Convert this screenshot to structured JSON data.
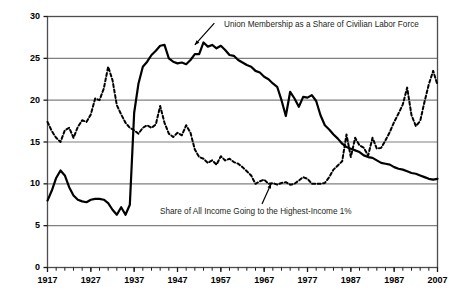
{
  "chart_data": {
    "type": "line",
    "title": "",
    "xlabel": "",
    "ylabel": "",
    "xlim": [
      1917,
      2007
    ],
    "ylim": [
      0,
      30
    ],
    "grid": true,
    "gridlines_y": [
      5,
      10,
      15,
      20,
      25
    ],
    "legend_position": "inline-annotations",
    "y_ticks": [
      "0",
      "5",
      "10",
      "15",
      "20",
      "25",
      "30"
    ],
    "y_tick_values": [
      0,
      5,
      10,
      15,
      20,
      25,
      30
    ],
    "x_ticks": [
      "1917",
      "1927",
      "1937",
      "1947",
      "1957",
      "1967",
      "1977",
      "1987",
      "1987",
      "2007"
    ],
    "x_tick_values": [
      1917,
      1927,
      1937,
      1947,
      1957,
      1967,
      1977,
      1987,
      1997,
      2007
    ],
    "minor_tick_interval": 2,
    "annotations": [
      {
        "name": "union-membership-label",
        "text": "Union Membership as a Share of Civilian Labor Force",
        "arrow_from": [
          1955.5,
          29.2
        ],
        "arrow_to": [
          1951.0,
          26.6
        ]
      },
      {
        "name": "top-income-share-label",
        "text": "Share of All Income Going to the Highest-Income 1%",
        "arrow_from": [
          1966.5,
          7.6
        ],
        "arrow_to": [
          1968.6,
          10.0
        ]
      }
    ],
    "series": [
      {
        "name": "Union Membership as a Share of Civilian Labor Force",
        "style": "solid",
        "color": "#000000",
        "width": 2.2,
        "x": [
          1917,
          1918,
          1919,
          1920,
          1921,
          1922,
          1923,
          1924,
          1925,
          1926,
          1927,
          1928,
          1929,
          1930,
          1931,
          1932,
          1933,
          1934,
          1935,
          1936,
          1937,
          1938,
          1939,
          1940,
          1941,
          1942,
          1943,
          1944,
          1945,
          1946,
          1947,
          1948,
          1949,
          1950,
          1951,
          1952,
          1953,
          1954,
          1955,
          1956,
          1957,
          1958,
          1959,
          1960,
          1961,
          1962,
          1963,
          1964,
          1965,
          1966,
          1967,
          1968,
          1969,
          1970,
          1971,
          1972,
          1973,
          1974,
          1975,
          1976,
          1977,
          1978,
          1979,
          1980,
          1981,
          1982,
          1983,
          1984,
          1985,
          1986,
          1987,
          1988,
          1989,
          1990,
          1991,
          1992,
          1993,
          1994,
          1995,
          1996,
          1997,
          1998,
          1999,
          2000,
          2001,
          2002,
          2003,
          2004,
          2005,
          2006,
          2007
        ],
        "y": [
          8.0,
          9.2,
          10.7,
          11.6,
          11.0,
          9.6,
          8.6,
          8.1,
          7.9,
          7.8,
          8.1,
          8.2,
          8.2,
          8.1,
          7.7,
          6.9,
          6.3,
          7.2,
          6.3,
          7.5,
          18.5,
          22.0,
          24.0,
          24.6,
          25.4,
          25.9,
          26.5,
          26.6,
          25.0,
          24.6,
          24.4,
          24.5,
          24.3,
          24.8,
          25.5,
          25.5,
          26.9,
          26.4,
          26.6,
          26.2,
          26.5,
          26.0,
          25.4,
          25.3,
          24.8,
          24.5,
          24.2,
          24.0,
          23.5,
          23.3,
          22.8,
          22.5,
          22.0,
          21.6,
          20.0,
          18.1,
          21.0,
          20.2,
          19.2,
          20.4,
          20.3,
          20.6,
          19.9,
          18.2,
          17.0,
          16.5,
          15.9,
          15.4,
          14.8,
          14.4,
          14.2,
          14.0,
          13.8,
          13.4,
          13.2,
          13.1,
          12.8,
          12.5,
          12.4,
          12.3,
          12.0,
          11.8,
          11.7,
          11.5,
          11.3,
          11.2,
          11.0,
          10.8,
          10.6,
          10.5,
          10.6
        ]
      },
      {
        "name": "Share of All Income Going to the Highest-Income 1%",
        "style": "dashed",
        "color": "#000000",
        "width": 2.0,
        "x": [
          1917,
          1918,
          1919,
          1920,
          1921,
          1922,
          1923,
          1924,
          1925,
          1926,
          1927,
          1928,
          1929,
          1930,
          1931,
          1932,
          1933,
          1934,
          1935,
          1936,
          1937,
          1938,
          1939,
          1940,
          1941,
          1942,
          1943,
          1944,
          1945,
          1946,
          1947,
          1948,
          1949,
          1950,
          1951,
          1952,
          1953,
          1954,
          1955,
          1956,
          1957,
          1958,
          1959,
          1960,
          1961,
          1962,
          1963,
          1964,
          1965,
          1966,
          1967,
          1968,
          1969,
          1970,
          1971,
          1972,
          1973,
          1974,
          1975,
          1976,
          1977,
          1978,
          1979,
          1980,
          1981,
          1982,
          1983,
          1984,
          1985,
          1986,
          1987,
          1988,
          1989,
          1990,
          1991,
          1992,
          1993,
          1994,
          1995,
          1996,
          1997,
          1998,
          1999,
          2000,
          2001,
          2002,
          2003,
          2004,
          2005,
          2006,
          2007
        ],
        "y": [
          17.4,
          16.3,
          15.5,
          15.0,
          16.4,
          16.7,
          15.5,
          16.8,
          17.6,
          17.4,
          18.3,
          20.2,
          20.0,
          21.4,
          24.0,
          22.4,
          19.4,
          18.3,
          17.3,
          16.7,
          16.4,
          16.0,
          16.7,
          17.0,
          16.7,
          17.1,
          19.3,
          17.3,
          16.0,
          15.6,
          16.1,
          15.8,
          17.0,
          16.1,
          14.1,
          13.2,
          13.0,
          12.5,
          12.8,
          12.3,
          13.3,
          12.8,
          13.0,
          12.6,
          12.4,
          12.0,
          11.5,
          11.0,
          10.0,
          10.3,
          10.5,
          10.0,
          10.1,
          9.9,
          10.1,
          10.2,
          9.9,
          10.0,
          10.4,
          10.8,
          10.6,
          10.0,
          10.0,
          10.0,
          10.1,
          10.8,
          11.7,
          12.2,
          12.7,
          15.9,
          13.2,
          15.5,
          14.6,
          14.3,
          13.4,
          15.5,
          14.2,
          14.3,
          15.2,
          16.2,
          17.4,
          18.4,
          19.5,
          21.5,
          18.2,
          16.9,
          17.5,
          19.8,
          21.9,
          23.5,
          21.8
        ]
      }
    ]
  },
  "axes": {
    "frame_color": "#4d4d4d",
    "grid_color": "#808080"
  }
}
